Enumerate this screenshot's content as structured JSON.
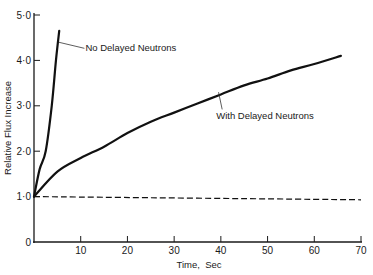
{
  "chart_data": {
    "type": "line",
    "title": "",
    "xlabel": "Time,  Sec",
    "ylabel": "Relative Flux Increase",
    "xlim": [
      0,
      70
    ],
    "ylim": [
      0,
      5.0
    ],
    "grid": false,
    "legend": "none (inline annotations)",
    "x_ticks": [
      10,
      20,
      30,
      40,
      50,
      60,
      70
    ],
    "x_tick_labels": [
      "10",
      "20",
      "30",
      "40",
      "50",
      "60",
      "70"
    ],
    "y_ticks": [
      0,
      1.0,
      2.0,
      3.0,
      4.0,
      5.0
    ],
    "y_tick_labels": [
      "0",
      "1·0",
      "2·0",
      "3·0",
      "4·0",
      "5·0"
    ],
    "series": [
      {
        "name": "No Delayed Neutrons",
        "style": "solid",
        "x": [
          0,
          1.2,
          2.5,
          3.8,
          4.7,
          5.4
        ],
        "y": [
          1.0,
          1.6,
          2.0,
          3.0,
          4.0,
          4.65
        ]
      },
      {
        "name": "With Delayed Neutrons",
        "style": "solid",
        "x": [
          0,
          5,
          10,
          15,
          20,
          25,
          30,
          35,
          40,
          45,
          50,
          55,
          60,
          65.7
        ],
        "y": [
          1.0,
          1.55,
          1.85,
          2.1,
          2.4,
          2.65,
          2.85,
          3.05,
          3.25,
          3.45,
          3.6,
          3.78,
          3.92,
          4.1
        ]
      },
      {
        "name": "Reference (initial flux)",
        "style": "dashed",
        "x": [
          0,
          70
        ],
        "y": [
          1.0,
          0.93
        ]
      }
    ],
    "annotations": [
      {
        "text": "No Delayed Neutrons",
        "x": 11,
        "y": 4.2,
        "points_to": [
          5.3,
          4.4
        ]
      },
      {
        "text": "With Delayed Neutrons",
        "x": 39,
        "y": 2.7,
        "points_to": [
          39.5,
          3.3
        ]
      }
    ]
  }
}
